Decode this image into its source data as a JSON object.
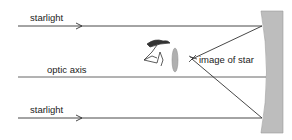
{
  "diagram": {
    "labels": {
      "starlight_top": "starlight",
      "optic_axis": "optic axis",
      "starlight_bottom": "starlight",
      "image_of_star": "image of star"
    },
    "elements": [
      {
        "id": "starlight-ray-top",
        "type": "incoming ray",
        "direction": "right"
      },
      {
        "id": "optic-axis",
        "type": "axis line"
      },
      {
        "id": "starlight-ray-bottom",
        "type": "incoming ray",
        "direction": "right"
      },
      {
        "id": "concave-mirror",
        "type": "primary mirror"
      },
      {
        "id": "reflected-ray-top",
        "type": "reflected ray",
        "to": "image of star"
      },
      {
        "id": "reflected-ray-bottom",
        "type": "reflected ray",
        "to": "image of star"
      },
      {
        "id": "eyepiece-lens",
        "type": "lens"
      },
      {
        "id": "observer",
        "type": "eye/observer"
      },
      {
        "id": "star-image",
        "type": "star glyph"
      }
    ],
    "colors": {
      "line": "#333333",
      "mirror_fill": "#bdbdbd",
      "lens_fill": "#b0b0b0",
      "text": "#222222"
    }
  }
}
